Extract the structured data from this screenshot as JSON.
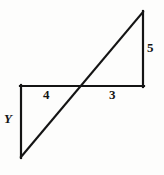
{
  "figure": {
    "background_color": "#fdfdfc",
    "stroke_color": "#141414",
    "stroke_width": 2,
    "width": 164,
    "height": 175,
    "labels": {
      "left_vertical": "Y",
      "left_horizontal": "4",
      "right_horizontal": "3",
      "right_vertical": "5"
    },
    "segments": {
      "diagonal": {
        "name": "diagonal-line",
        "x1": 21,
        "y1": 157,
        "x2": 143,
        "y2": 12
      },
      "horizontal": {
        "name": "horizontal-line",
        "x1": 21,
        "y1": 86,
        "x2": 143,
        "y2": 86
      },
      "left_vertical": {
        "name": "left-vertical-line",
        "x1": 21,
        "y1": 86,
        "x2": 21,
        "y2": 157
      },
      "right_vertical": {
        "name": "right-vertical-line",
        "x1": 143,
        "y1": 12,
        "x2": 143,
        "y2": 86
      }
    },
    "intersection": {
      "name": "intersection-point",
      "x": 81,
      "y": 86
    }
  },
  "chart_data": {
    "type": "diagram",
    "shapes": [
      {
        "name": "lower-left-triangle",
        "vertices": [
          [
            21,
            86
          ],
          [
            81,
            86
          ],
          [
            21,
            157
          ]
        ],
        "legs": {
          "horizontal": "4",
          "vertical": "Y"
        }
      },
      {
        "name": "upper-right-triangle",
        "vertices": [
          [
            81,
            86
          ],
          [
            143,
            86
          ],
          [
            143,
            12
          ]
        ],
        "legs": {
          "horizontal": "3",
          "vertical": "5"
        }
      }
    ],
    "annotations": [
      {
        "text": "Y",
        "x": 10,
        "y": 119,
        "style": "italic-bold"
      },
      {
        "text": "4",
        "x": 47,
        "y": 95,
        "style": "bold"
      },
      {
        "text": "3",
        "x": 113,
        "y": 95,
        "style": "bold"
      },
      {
        "text": "5",
        "x": 151,
        "y": 48,
        "style": "bold"
      }
    ]
  }
}
